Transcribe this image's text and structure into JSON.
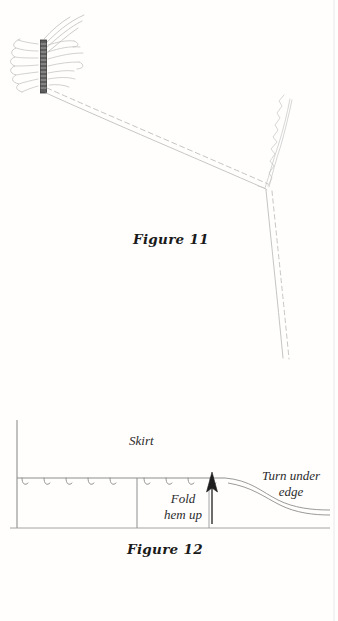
{
  "page": {
    "kind": "sewing-instruction-figures",
    "width": 338,
    "height": 621,
    "background_color": "#fffefd",
    "ink_color": "#9a9a9a",
    "text_color": "#1a1a1a"
  },
  "figure11": {
    "caption": "Figure 11",
    "description": "Gathered sleeve attached to a cuff band, with seam line and parallel stitching line running to the underarm junction and down the side seam",
    "parts": {
      "cuff_band": "cuff-band",
      "gathers": "gather-lines",
      "seam_line": "seam-line",
      "stitch_line": "dashed-stitching-line",
      "serged_edge": "zigzag-overlock-edge",
      "side_seam": "side-seam-line"
    }
  },
  "figure12": {
    "caption": "Figure 12",
    "description": "Cross-section of a skirt hem showing the hem folded up, hand hemming stitches, and the raw edge turned under",
    "labels": {
      "skirt": "Skirt",
      "fold_line1": "Fold",
      "fold_line2": "hem up",
      "turn_line1": "Turn under",
      "turn_line2": "edge"
    },
    "parts": {
      "hem_stitches": "hem-stitch-marks",
      "fold_arrow": "fold-up-arrow",
      "turn_under_curves": "turned-under-edge-curves",
      "skirt_panel_edge": "skirt-left-edge",
      "hem_baseline": "hem-bottom-line",
      "fold_crease": "fold-crease-line"
    }
  }
}
